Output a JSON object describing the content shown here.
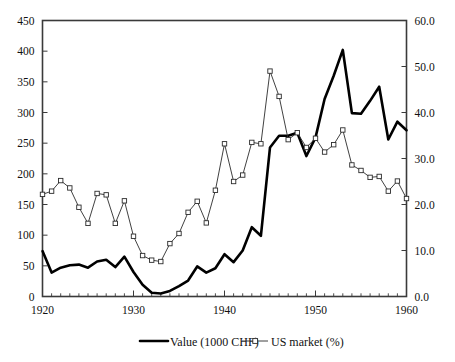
{
  "chart_data": {
    "type": "line",
    "title": "",
    "subtitle": "",
    "xlabel": "",
    "ylabel": "",
    "grid": false,
    "legend_position": "bottom-center",
    "x": [
      1920,
      1921,
      1922,
      1923,
      1924,
      1925,
      1926,
      1927,
      1928,
      1929,
      1930,
      1931,
      1932,
      1933,
      1934,
      1935,
      1936,
      1937,
      1938,
      1939,
      1940,
      1941,
      1942,
      1943,
      1944,
      1945,
      1946,
      1947,
      1948,
      1949,
      1950,
      1951,
      1952,
      1953,
      1954,
      1955,
      1956,
      1957,
      1958,
      1959,
      1960
    ],
    "x_tick_labels": [
      "1920",
      "1930",
      "1940",
      "1950",
      "1960"
    ],
    "x_tick_values": [
      1920,
      1930,
      1940,
      1950,
      1960
    ],
    "xlim": [
      1920,
      1960
    ],
    "axes": [
      {
        "id": "left",
        "label": "",
        "ylim": [
          0,
          450
        ],
        "ticks": [
          0,
          50,
          100,
          150,
          200,
          250,
          300,
          350,
          400,
          450
        ],
        "tick_labels": [
          "0",
          "50",
          "100",
          "150",
          "200",
          "250",
          "300",
          "350",
          "400",
          "450"
        ]
      },
      {
        "id": "right",
        "label": "",
        "ylim": [
          0.0,
          60.0
        ],
        "ticks": [
          0.0,
          10.0,
          20.0,
          30.0,
          40.0,
          50.0,
          60.0
        ],
        "tick_labels": [
          "0.0",
          "10.0",
          "20.0",
          "30.0",
          "40.0",
          "50.0",
          "60.0"
        ]
      }
    ],
    "series": [
      {
        "name": "Value (1000 CHF)",
        "axis": "left",
        "style": "thick-line",
        "marker": "none",
        "color": "#000000",
        "values": [
          74,
          39,
          47,
          51,
          52,
          47,
          57,
          60,
          48,
          65,
          40,
          19,
          6,
          5,
          9,
          17,
          26,
          49,
          39,
          46,
          69,
          56,
          75,
          113,
          99,
          243,
          262,
          262,
          267,
          229,
          259,
          322,
          360,
          402,
          299,
          298,
          319,
          342,
          256,
          285,
          271
        ]
      },
      {
        "name": "US market (%)",
        "axis": "right",
        "style": "thin-line",
        "marker": "open-square",
        "color": "#2b2b2b",
        "values": [
          22.2,
          22.9,
          25.2,
          23.6,
          19.4,
          15.9,
          22.4,
          22.1,
          15.9,
          20.8,
          13.1,
          8.9,
          7.9,
          7.6,
          11.5,
          13.7,
          18.3,
          20.7,
          16.0,
          23.1,
          33.2,
          25.0,
          26.4,
          33.5,
          33.2,
          49.0,
          43.5,
          34.1,
          35.6,
          32.4,
          34.4,
          31.4,
          33.0,
          36.2,
          28.6,
          27.4,
          25.9,
          26.1,
          22.9,
          25.1,
          21.3
        ]
      }
    ],
    "legend": [
      {
        "label": "Value (1000 CHF)",
        "marker": "thick-line"
      },
      {
        "label": "US market (%)",
        "marker": "thin-line-square"
      }
    ]
  },
  "figure": {
    "background": "#ffffff",
    "frame_color": "#3a3a3a",
    "caption_fragment": ""
  }
}
